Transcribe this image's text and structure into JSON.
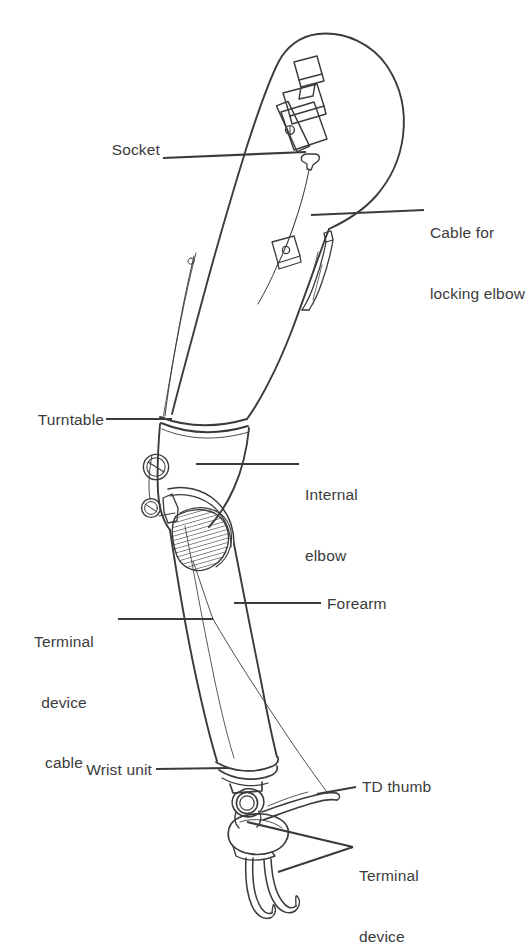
{
  "figure": {
    "type": "labeled-line-illustration",
    "background_color": "#ffffff",
    "ink_color": "#3b3b3d",
    "text_color": "#3b3b3d",
    "canvas": {
      "width": 528,
      "height": 931
    }
  },
  "labels": [
    {
      "id": "socket",
      "text": "Socket",
      "align": "right",
      "x": 104,
      "y": 148,
      "leader": {
        "from": [
          163,
          158
        ],
        "to": [
          306,
          153
        ]
      },
      "points_to": "socket-body"
    },
    {
      "id": "cable-for-locking-elbow",
      "text": "Cable for\nlocking elbow",
      "line1": "Cable for",
      "line2": "locking elbow",
      "align": "left",
      "x": 430,
      "y": 185,
      "leader": {
        "from": [
          424,
          210
        ],
        "to": [
          311,
          214
        ]
      },
      "points_to": "locking-cable"
    },
    {
      "id": "turntable",
      "text": "Turntable",
      "align": "right",
      "x": 14,
      "y": 410,
      "leader": {
        "from": [
          106,
          419
        ],
        "to": [
          172,
          419
        ]
      },
      "points_to": "turntable-joint"
    },
    {
      "id": "internal-elbow",
      "text": "Internal\nelbow",
      "line1": "Internal",
      "line2": "elbow",
      "align": "left",
      "x": 305,
      "y": 444,
      "leader": {
        "from": [
          299,
          464
        ],
        "to": [
          196,
          464
        ]
      },
      "points_to": "internal-elbow-mechanism"
    },
    {
      "id": "terminal-device-cable",
      "text": "Terminal\ndevice\ncable",
      "line1": "Terminal",
      "line2": "device",
      "line3": "cable",
      "align": "center",
      "x": 18,
      "y": 592,
      "leader": {
        "from": [
          118,
          619
        ],
        "to": [
          212,
          619
        ]
      },
      "points_to": "td-cable"
    },
    {
      "id": "forearm",
      "text": "Forearm",
      "align": "left",
      "x": 327,
      "y": 594,
      "leader": {
        "from": [
          321,
          603
        ],
        "to": [
          235,
          603
        ]
      },
      "points_to": "forearm-shell"
    },
    {
      "id": "wrist-unit",
      "text": "Wrist unit",
      "align": "right",
      "x": 69,
      "y": 760,
      "leader": {
        "from": [
          156,
          769
        ],
        "to": [
          228,
          769
        ]
      },
      "points_to": "wrist-unit-body"
    },
    {
      "id": "td-thumb",
      "text": "TD thumb",
      "align": "left",
      "x": 362,
      "y": 777,
      "leader": {
        "from": [
          356,
          787
        ],
        "to": [
          318,
          793
        ]
      },
      "points_to": "thumb"
    },
    {
      "id": "terminal-device",
      "text": "Terminal\ndevice",
      "line1": "Terminal",
      "line2": "device",
      "align": "left",
      "x": 359,
      "y": 827,
      "leader_fork": {
        "apex": [
          353,
          847
        ],
        "to_upper": [
          247,
          823
        ],
        "to_lower": [
          277,
          872
        ]
      },
      "points_to": "terminal-device-hook"
    }
  ],
  "parts": [
    {
      "id": "socket-body",
      "name": "Socket"
    },
    {
      "id": "harness-buckle",
      "name": "Harness buckle hardware"
    },
    {
      "id": "locking-cable",
      "name": "Cable for locking elbow"
    },
    {
      "id": "cable-pull-tab",
      "name": "Cable pull tab"
    },
    {
      "id": "cable-retainer",
      "name": "Cable retainer fitting"
    },
    {
      "id": "turntable-joint",
      "name": "Turntable"
    },
    {
      "id": "internal-elbow-mechanism",
      "name": "Internal elbow"
    },
    {
      "id": "elbow-hatched-panel",
      "name": "Hatched elbow panel"
    },
    {
      "id": "elbow-hinge-upper",
      "name": "Upper elbow hinge bolt"
    },
    {
      "id": "elbow-hinge-lower",
      "name": "Lower elbow hinge bolt"
    },
    {
      "id": "forearm-shell",
      "name": "Forearm"
    },
    {
      "id": "td-cable",
      "name": "Terminal device cable"
    },
    {
      "id": "wrist-unit-body",
      "name": "Wrist unit"
    },
    {
      "id": "wrist-pivot",
      "name": "Wrist pivot ring"
    },
    {
      "id": "terminal-device-hook",
      "name": "Terminal device"
    },
    {
      "id": "thumb",
      "name": "TD thumb"
    },
    {
      "id": "hook-finger-outer",
      "name": "Outer hook finger"
    },
    {
      "id": "hook-finger-inner",
      "name": "Inner hook finger"
    }
  ]
}
